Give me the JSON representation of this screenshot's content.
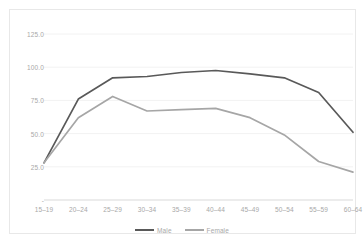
{
  "chart_data": {
    "type": "line",
    "title": "",
    "subtitle": "",
    "xlabel": "",
    "ylabel": "",
    "categories": [
      "15–19",
      "20–24",
      "25–29",
      "30–34",
      "35–39",
      "40–44",
      "45–49",
      "50–54",
      "55–59",
      "60–64"
    ],
    "series": [
      {
        "name": "Male",
        "color": "#595959",
        "values": [
          28,
          76,
          92,
          93,
          96,
          97.5,
          95,
          92,
          81,
          51
        ]
      },
      {
        "name": "Female",
        "color": "#a6a6a6",
        "values": [
          28,
          62,
          78,
          67,
          68,
          69,
          62,
          49,
          29,
          21
        ]
      }
    ],
    "ylim": [
      0,
      137.5
    ],
    "yticks": [
      125.0,
      100.0,
      75.0,
      50.0,
      25.0
    ],
    "ytick_labels": [
      "125.0",
      "100.0",
      "75.0",
      "50.0",
      "25.0"
    ],
    "y_zero_label": "-",
    "grid": true,
    "grid_color": "#f2f2f2",
    "axis_color": "#d9d9d9",
    "legend_position": "bottom",
    "legend": [
      {
        "label": "Male",
        "color": "#595959"
      },
      {
        "label": "Female",
        "color": "#a6a6a6"
      }
    ]
  }
}
